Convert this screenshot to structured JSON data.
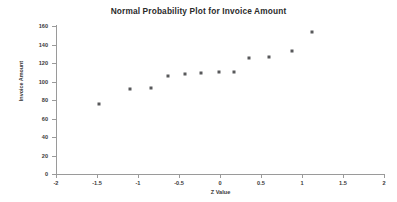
{
  "chart_data": {
    "type": "scatter",
    "title": "Normal Probability Plot for Invoice Amount",
    "xlabel": "Z Value",
    "ylabel": "Invoice Amount",
    "xlim": [
      -2,
      2
    ],
    "ylim": [
      0,
      160
    ],
    "xticks": [
      -2,
      -1.5,
      -1,
      -0.5,
      0,
      0.5,
      1,
      1.5,
      2
    ],
    "xtick_labels": [
      "-2",
      "-1.5",
      "-1",
      "-0.5",
      "0",
      "0.5",
      "1",
      "1.5",
      "2"
    ],
    "yticks": [
      0,
      20,
      40,
      60,
      80,
      100,
      120,
      140,
      160
    ],
    "ytick_labels": [
      "0",
      "20",
      "40",
      "60",
      "80",
      "100",
      "120",
      "140",
      "160"
    ],
    "grid": false,
    "legend": null,
    "marker_color": "#58595b",
    "series": [
      {
        "name": "Invoice Amount",
        "points": [
          {
            "x": -1.47,
            "y": 76
          },
          {
            "x": -1.1,
            "y": 92
          },
          {
            "x": -0.84,
            "y": 93
          },
          {
            "x": -0.63,
            "y": 106
          },
          {
            "x": -0.43,
            "y": 108
          },
          {
            "x": -0.23,
            "y": 109
          },
          {
            "x": -0.01,
            "y": 110
          },
          {
            "x": 0.17,
            "y": 110
          },
          {
            "x": 0.35,
            "y": 125
          },
          {
            "x": 0.6,
            "y": 126
          },
          {
            "x": 0.88,
            "y": 133
          },
          {
            "x": 1.12,
            "y": 154
          }
        ]
      }
    ]
  }
}
